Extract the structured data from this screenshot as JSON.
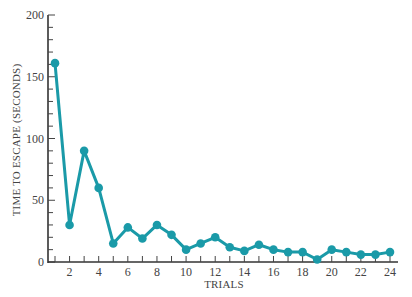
{
  "chart_data": {
    "type": "line",
    "title": "",
    "xlabel": "TRIALS",
    "ylabel": "TIME TO ESCAPE (SECONDS)",
    "x": [
      1,
      2,
      3,
      4,
      5,
      6,
      7,
      8,
      9,
      10,
      11,
      12,
      13,
      14,
      15,
      16,
      17,
      18,
      19,
      20,
      21,
      22,
      23,
      24
    ],
    "series": [
      {
        "name": "Time to escape",
        "values": [
          161,
          30,
          90,
          60,
          15,
          28,
          19,
          30,
          22,
          10,
          15,
          20,
          12,
          9,
          14,
          10,
          8,
          8,
          2,
          10,
          8,
          6,
          6,
          8
        ]
      }
    ],
    "xlim": [
      0.5,
      24.5
    ],
    "ylim": [
      0,
      200
    ],
    "x_ticks": [
      2,
      4,
      6,
      8,
      10,
      12,
      14,
      16,
      18,
      20,
      22,
      24
    ],
    "y_ticks": [
      0,
      50,
      100,
      150,
      200
    ],
    "y_minor_step": 10,
    "grid": false,
    "legend": null,
    "line_color": "#1a9aa8"
  }
}
